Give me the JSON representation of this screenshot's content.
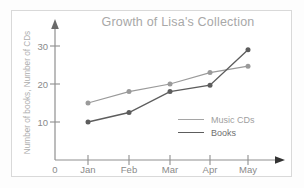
{
  "chart_data": {
    "type": "line",
    "title": "Growth of Lisa's Collection",
    "xlabel": "",
    "ylabel": "Number of books, Number of CDs",
    "categories": [
      "Jan",
      "Feb",
      "Mar",
      "Apr",
      "May"
    ],
    "x_origin_label": "0",
    "xtick_labels": [
      "0",
      "Jan",
      "Feb",
      "Mar",
      "Apr",
      "May"
    ],
    "ytick_labels": [
      "10",
      "20",
      "30"
    ],
    "ytick_values": [
      10,
      20,
      30
    ],
    "ylim": [
      0,
      33
    ],
    "grid": false,
    "legend_position": "inside-bottom-right",
    "series": [
      {
        "name": "Music CDs",
        "color": "#9a9a9a",
        "values": [
          15,
          18,
          20,
          23,
          24.7
        ]
      },
      {
        "name": "Books",
        "color": "#5d5d5d",
        "values": [
          10,
          12.5,
          18,
          19.7,
          29
        ]
      }
    ]
  },
  "colors": {
    "music_cds": "#9a9a9a",
    "books": "#5d5d5d",
    "axis": "#8f8f8f",
    "title": "#a8a8a8",
    "frame": "#d9d9d9"
  }
}
